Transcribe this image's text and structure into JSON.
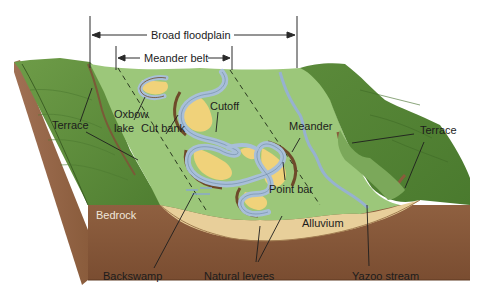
{
  "figure": {
    "dimensions": {
      "broad_floodplain": "Broad floodplain",
      "meander_belt": "Meander belt"
    },
    "labels": {
      "terrace_left": "Terrace",
      "oxbow_lake_line1": "Oxbow",
      "oxbow_lake_line2": "lake",
      "cut_bank": "Cut bank",
      "cutoff": "Cutoff",
      "meander": "Meander",
      "terrace_right": "Terrace",
      "point_bar": "Point bar",
      "bedrock": "Bedrock",
      "alluvium": "Alluvium",
      "backswamp": "Backswamp",
      "natural_levees": "Natural levees",
      "yazoo_stream": "Yazoo stream"
    },
    "colors": {
      "floodplain_green": "#9cc77a",
      "terrace_green": "#5d8f3c",
      "bedrock_brown": "#8a5c3c",
      "alluvium_tan": "#e8cf9a",
      "river_blue": "#a8bfd8",
      "point_bar_yellow": "#f0d27a"
    }
  }
}
